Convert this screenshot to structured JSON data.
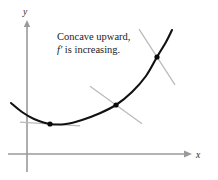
{
  "figure": {
    "background_color": "#ffffff",
    "axis_color": "#9a9a9a",
    "curve_color": "#111111",
    "point_color": "#0a0a0a",
    "tangent_color": "#b9b9b9",
    "text_color": "#1c1c1c"
  },
  "axes": {
    "x_label": "x",
    "y_label": "y",
    "x_axis_y": 154,
    "y_axis_x": 27,
    "x_axis_start": 8,
    "x_axis_end": 190,
    "y_axis_top": 22,
    "y_axis_bottom": 172
  },
  "annotation": {
    "line1": "Concave upward,",
    "line2_symbol": "f",
    "line2_prime": "′",
    "line2_rest": " is increasing.",
    "line2_full": "f′ is increasing.",
    "x": 57,
    "y1": 40,
    "y2": 53
  },
  "chart_data": {
    "type": "line",
    "title": "Concave upward, f′ is increasing.",
    "xlabel": "x",
    "ylabel": "y",
    "grid": false,
    "legend": "none",
    "curve_description": "Upward-opening parabola-like curve, concave upward everywhere, with minimum near the left and rising steeply to the right.",
    "curve_points_px": [
      [
        11,
        103
      ],
      [
        22,
        112
      ],
      [
        34,
        119
      ],
      [
        50,
        124
      ],
      [
        66,
        124
      ],
      [
        82,
        120
      ],
      [
        98,
        114
      ],
      [
        116,
        105
      ],
      [
        132,
        92
      ],
      [
        146,
        76
      ],
      [
        157,
        57
      ],
      [
        166,
        42
      ],
      [
        172,
        30
      ]
    ],
    "marked_points": [
      {
        "label": "point-1",
        "x_px": 50,
        "y_px": 124,
        "tangent_slope": -0.06,
        "tangent_half_length": 30
      },
      {
        "label": "point-2",
        "x_px": 116,
        "y_px": 105,
        "tangent_slope": -0.72,
        "tangent_half_length": 26
      },
      {
        "label": "point-3",
        "x_px": 157,
        "y_px": 57,
        "tangent_slope": -1.55,
        "tangent_half_length": 18
      }
    ],
    "marked_point_count": 3,
    "point_radius_px": 2.6
  }
}
